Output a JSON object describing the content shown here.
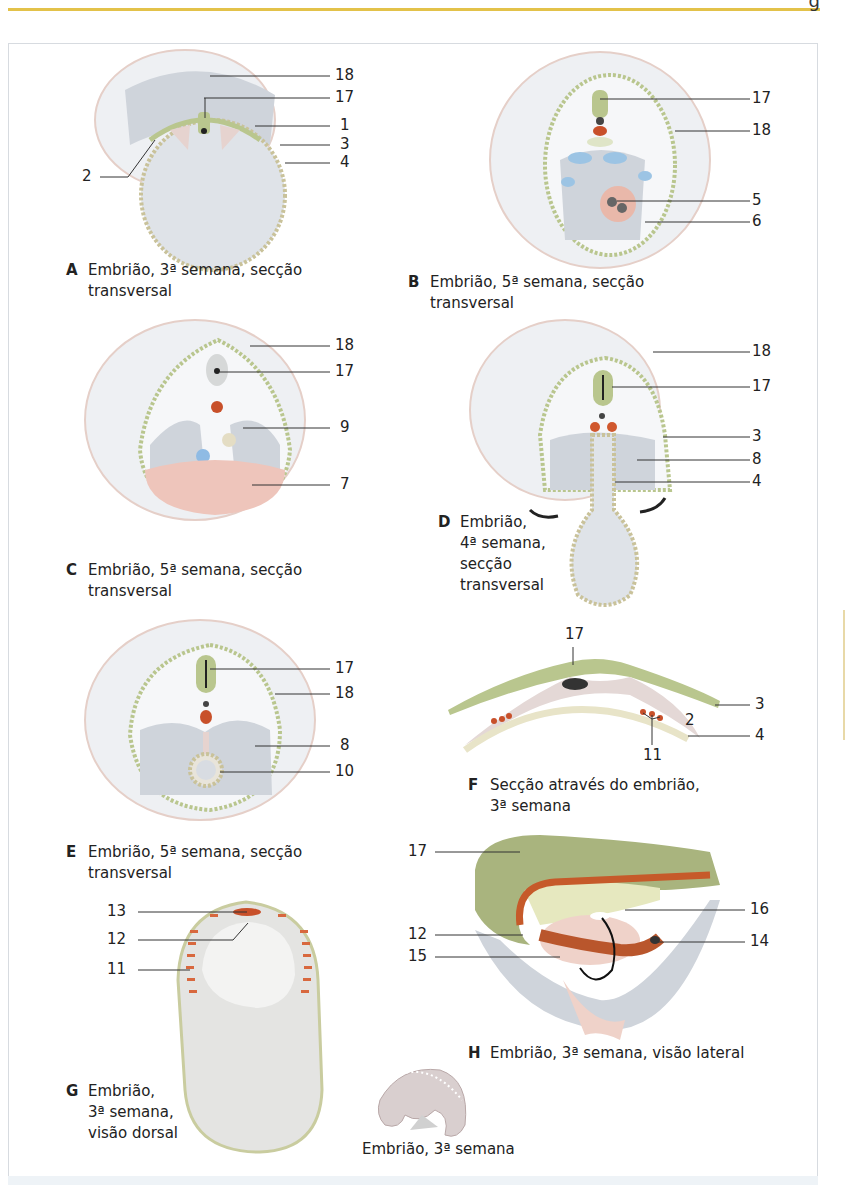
{
  "page": {
    "header_rule_color": "#e3c24a",
    "page_number_fragment": "g"
  },
  "figures": {
    "A": {
      "letter": "A",
      "caption_line1": "Embrião, 3ª semana, secção",
      "caption_line2": "transversal",
      "labels": [
        "18",
        "17",
        "1",
        "3",
        "4",
        "2"
      ]
    },
    "B": {
      "letter": "B",
      "caption_line1": "Embrião, 5ª semana, secção",
      "caption_line2": "transversal",
      "labels": [
        "17",
        "18",
        "5",
        "6"
      ]
    },
    "C": {
      "letter": "C",
      "caption_line1": "Embrião, 5ª semana, secção",
      "caption_line2": "transversal",
      "labels": [
        "18",
        "17",
        "9",
        "7"
      ]
    },
    "D": {
      "letter": "D",
      "caption_line1": "Embrião,",
      "caption_line2": "4ª semana,",
      "caption_line3": "secção",
      "caption_line4": "transversal",
      "labels": [
        "18",
        "17",
        "3",
        "8",
        "4"
      ]
    },
    "E": {
      "letter": "E",
      "caption_line1": "Embrião, 5ª semana, secção",
      "caption_line2": "transversal",
      "labels": [
        "17",
        "18",
        "8",
        "10"
      ]
    },
    "F": {
      "letter": "F",
      "caption_line1": "Secção através do embrião,",
      "caption_line2": "3ª semana",
      "labels": [
        "17",
        "3",
        "2",
        "4",
        "11"
      ]
    },
    "G": {
      "letter": "G",
      "caption_line1": "Embrião,",
      "caption_line2": "3ª semana,",
      "caption_line3": "visão dorsal",
      "labels": [
        "13",
        "12",
        "11"
      ]
    },
    "H": {
      "letter": "H",
      "caption_line1": "Embrião, 3ª semana, visão lateral",
      "labels": [
        "17",
        "16",
        "12",
        "14",
        "15"
      ]
    },
    "inset": {
      "caption": "Embrião, 3ª semana"
    }
  },
  "colors": {
    "ectoderm_green": "#b9c68e",
    "amnion_pink": "#e8cfc8",
    "heart_pink": "#efc3b6",
    "vessel_red": "#c8502a",
    "vein_blue": "#9cc4e4",
    "cavity_gray": "#c9ced6"
  }
}
